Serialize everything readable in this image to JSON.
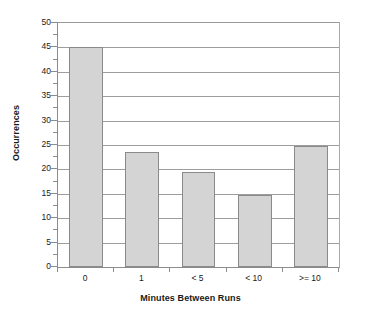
{
  "chart_data": {
    "type": "bar",
    "title": "",
    "subtitle": "",
    "xlabel": "Minutes Between Runs",
    "ylabel": "Occurrences",
    "categories": [
      "0",
      "1",
      "< 5",
      "< 10",
      ">= 10"
    ],
    "values": [
      45,
      23.5,
      19.5,
      14.8,
      24.7
    ],
    "series": [
      {
        "name": "Occurrences",
        "values": [
          45,
          23.5,
          19.5,
          14.8,
          24.7
        ]
      }
    ],
    "ylim": [
      0,
      50
    ],
    "y_ticks": [
      0,
      5,
      10,
      15,
      20,
      25,
      30,
      35,
      40,
      45,
      50
    ],
    "y_tick_labels": [
      "0",
      "5",
      "10",
      "15",
      "20",
      "25",
      "30",
      "35",
      "40",
      "45",
      "50"
    ],
    "y_minor_tick_interval": 2.5,
    "grid": "horizontal",
    "legend": "none",
    "annotations": [],
    "colors": {
      "bar_fill": "#d4d4d4",
      "bar_border": "#8a8a8a",
      "gridline": "#9d9d9d",
      "axis_line": "#8c8c8c",
      "plot_background": "#ffffff",
      "page_background": "#ffffff",
      "text": "#1a1a1a"
    }
  }
}
